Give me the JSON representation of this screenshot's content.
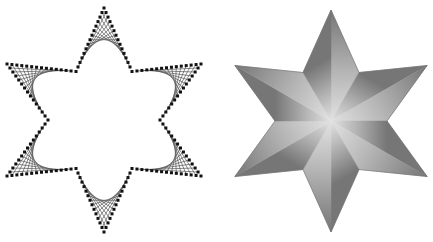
{
  "page": {
    "background_color": "#ffffff",
    "width": 433,
    "height": 242,
    "caption": ""
  },
  "figures": [
    {
      "id": "string-art-hexagram",
      "label": "String-art hexagram",
      "style": "line-drawing",
      "stroke_color": "#555555",
      "dot_color": "#111111",
      "fill_color": "none",
      "dot_size": 3,
      "stroke_width": 0.7,
      "divisions": 13,
      "center": {
        "x": 104,
        "y": 120
      },
      "outer_radius": 112,
      "inner_radius": 56,
      "rotation_deg": -90,
      "points": 6
    },
    {
      "id": "shaded-hexagram",
      "label": "Shaded hexagram",
      "style": "filled-gradient",
      "stroke_color": "#6f6f6f",
      "fill_center_color": "#e2e2e2",
      "fill_mid_color": "#b4b4b4",
      "fill_edge_color": "#767676",
      "stroke_width": 0.6,
      "center": {
        "x": 115,
        "y": 121
      },
      "outer_radius": 111,
      "inner_radius": 56,
      "rotation_deg": -90,
      "points": 6
    }
  ],
  "colors": {
    "background": "#ffffff",
    "ink": "#111111",
    "line": "#555555",
    "shade_light": "#e2e2e2",
    "shade_mid": "#b4b4b4",
    "shade_dark": "#767676"
  }
}
